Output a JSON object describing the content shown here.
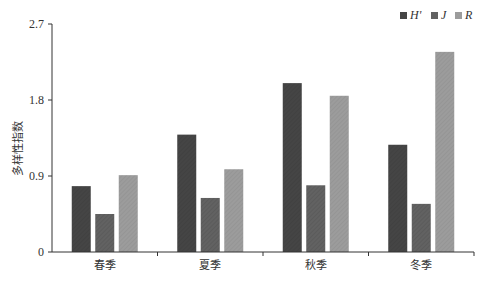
{
  "chart_data": {
    "type": "bar",
    "title": "",
    "xlabel": "",
    "ylabel": "多样性指数",
    "categories": [
      "春季",
      "夏季",
      "秋季",
      "冬季"
    ],
    "series": [
      {
        "name": "H'",
        "color": "#454545",
        "values": [
          0.78,
          1.39,
          2.0,
          1.27
        ]
      },
      {
        "name": "J",
        "color": "#626262",
        "values": [
          0.45,
          0.64,
          0.79,
          0.57
        ]
      },
      {
        "name": "R",
        "color": "#9c9c9c",
        "values": [
          0.91,
          0.98,
          1.85,
          2.37
        ]
      }
    ],
    "yticks": [
      "0",
      "0.9",
      "1.8",
      "2.7"
    ],
    "ytick_values": [
      0,
      0.9,
      1.8,
      2.7
    ],
    "ylim": [
      0,
      2.7
    ],
    "grid": false,
    "legend_position": "top-right"
  }
}
